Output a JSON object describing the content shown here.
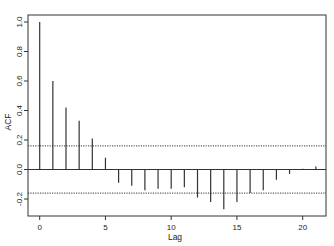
{
  "chart_data": {
    "type": "bar",
    "subtype": "acf-correlogram",
    "title": "",
    "xlabel": "Lag",
    "ylabel": "ACF",
    "xlim": [
      -0.9,
      21.8
    ],
    "ylim": [
      -0.32,
      1.05
    ],
    "x_ticks": [
      0,
      5,
      10,
      15,
      20
    ],
    "x_tick_labels": [
      "0",
      "5",
      "10",
      "15",
      "20"
    ],
    "y_ticks": [
      -0.2,
      0.0,
      0.2,
      0.4,
      0.6,
      0.8,
      1.0
    ],
    "y_tick_labels": [
      "-0.2",
      "0.0",
      "0.2",
      "0.4",
      "0.6",
      "0.8",
      "1.0"
    ],
    "grid": false,
    "legend": null,
    "lags": [
      0,
      1,
      2,
      3,
      4,
      5,
      6,
      7,
      8,
      9,
      10,
      11,
      12,
      13,
      14,
      15,
      16,
      17,
      18,
      19,
      20,
      21
    ],
    "values": [
      1.0,
      0.6,
      0.42,
      0.33,
      0.21,
      0.08,
      -0.09,
      -0.11,
      -0.14,
      -0.13,
      -0.13,
      -0.12,
      -0.19,
      -0.22,
      -0.27,
      -0.22,
      -0.16,
      -0.14,
      -0.07,
      -0.03,
      0.005,
      0.02
    ],
    "confidence_bounds": {
      "upper": 0.16,
      "lower": -0.16,
      "style": "dotted"
    },
    "zero_line": true
  },
  "colors": {
    "bars": "#333333",
    "axes": "#333333",
    "confidence": "#333333",
    "background": "#ffffff"
  }
}
